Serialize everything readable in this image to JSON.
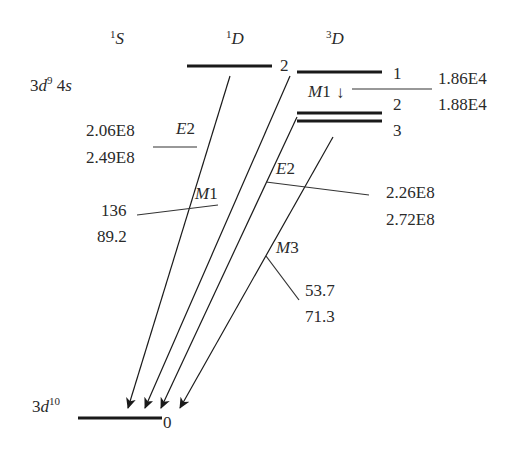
{
  "diagram": {
    "type": "energy-level-diagram",
    "terms": [
      {
        "id": "1S",
        "sup": "1",
        "letter": "S"
      },
      {
        "id": "1D",
        "sup": "1",
        "letter": "D"
      },
      {
        "id": "3D",
        "sup": "3",
        "letter": "D"
      }
    ],
    "upper_config": {
      "base": "3",
      "italic": "d",
      "sup": "9",
      "rest": " 4",
      "rest_italic": "s"
    },
    "lower_config": {
      "base": "3",
      "italic": "d",
      "sup": "10"
    },
    "levels": [
      {
        "term": "1D",
        "J": "2"
      },
      {
        "term": "3D",
        "J": "1"
      },
      {
        "term": "3D",
        "J": "2"
      },
      {
        "term": "3D",
        "J": "3"
      },
      {
        "term": "ground",
        "J": "0"
      }
    ],
    "transitions": [
      {
        "type_letter": "M",
        "type_num": "1",
        "from": "3D1",
        "to": "3D2",
        "value1": "1.86E4",
        "value2": "1.88E4",
        "arrow": "↓"
      },
      {
        "type_letter": "E",
        "type_num": "2",
        "from": "1D2",
        "to": "0",
        "value1": "2.06E8",
        "value2": "2.49E8"
      },
      {
        "type_letter": "M",
        "type_num": "1",
        "from": "3D1",
        "to": "0",
        "value1": "136",
        "value2": "89.2"
      },
      {
        "type_letter": "E",
        "type_num": "2",
        "from": "3D2",
        "to": "0",
        "value1": "2.26E8",
        "value2": "2.72E8"
      },
      {
        "type_letter": "M",
        "type_num": "3",
        "from": "3D3",
        "to": "0",
        "value1": "53.7",
        "value2": "71.3"
      }
    ]
  }
}
